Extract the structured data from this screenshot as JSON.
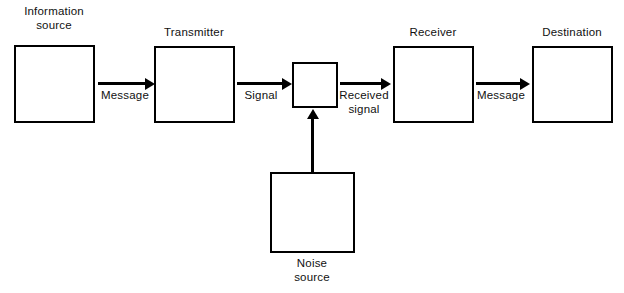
{
  "diagram": {
    "stroke_color": "#000000",
    "background_color": "#ffffff",
    "nodes": [
      {
        "id": "information-source",
        "label": "Information\nsource"
      },
      {
        "id": "transmitter",
        "label": "Transmitter"
      },
      {
        "id": "channel-junction",
        "label": ""
      },
      {
        "id": "receiver",
        "label": "Receiver"
      },
      {
        "id": "destination",
        "label": "Destination"
      },
      {
        "id": "noise-source",
        "label": "Noise\nsource"
      }
    ],
    "edges": [
      {
        "id": "source-to-transmitter",
        "label": "Message",
        "direction": "right"
      },
      {
        "id": "transmitter-to-channel",
        "label": "Signal",
        "direction": "right"
      },
      {
        "id": "channel-to-receiver",
        "label": "Received\nsignal",
        "direction": "right"
      },
      {
        "id": "receiver-to-destination",
        "label": "Message",
        "direction": "right"
      },
      {
        "id": "noise-to-channel",
        "label": "",
        "direction": "up"
      }
    ]
  }
}
